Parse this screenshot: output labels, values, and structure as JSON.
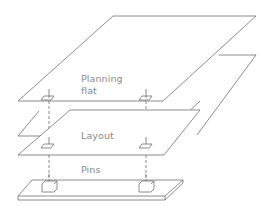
{
  "diagram": {
    "type": "exploded-layer-stack",
    "layers": [
      {
        "id": "planning-flat",
        "label_line1": "Planning",
        "label_line2": "flat"
      },
      {
        "id": "layout",
        "label": "Layout"
      },
      {
        "id": "pins",
        "label": "Pins"
      }
    ],
    "colors": {
      "line": "#6e6e6e",
      "text": "#8a8a8a",
      "background": "#ffffff"
    }
  }
}
